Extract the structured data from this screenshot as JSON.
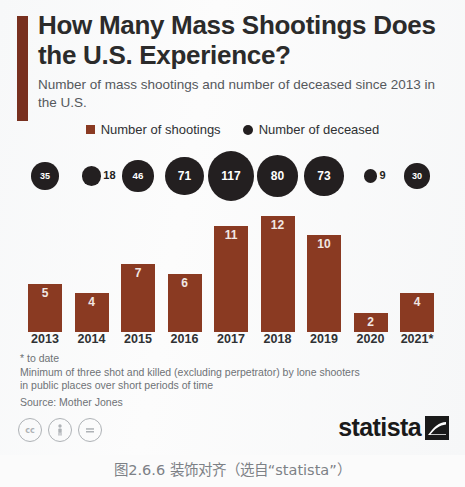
{
  "header": {
    "title": "How Many Mass Shootings Does the U.S. Experience?",
    "subtitle": "Number of mass shootings and number of deceased since 2013 in the U.S.",
    "accent_color": "#78301f"
  },
  "legend": {
    "shootings_label": "Number of shootings",
    "deceased_label": "Number of deceased",
    "shootings_color": "#8a3a22",
    "deceased_color": "#231f20"
  },
  "chart_data": {
    "type": "bar",
    "title": "How Many Mass Shootings Does the U.S. Experience?",
    "subtitle": "Number of mass shootings and number of deceased since 2013 in the U.S.",
    "xlabel": "",
    "ylabel": "",
    "grid": false,
    "legend_position": "top-center",
    "categories": [
      "2013",
      "2014",
      "2015",
      "2016",
      "2017",
      "2018",
      "2019",
      "2020",
      "2021*"
    ],
    "series": [
      {
        "name": "Number of shootings",
        "type": "bar",
        "color": "#8a3a22",
        "values": [
          5,
          4,
          7,
          6,
          11,
          12,
          10,
          2,
          4
        ]
      },
      {
        "name": "Number of deceased",
        "type": "bubble",
        "color": "#231f20",
        "values": [
          35,
          18,
          46,
          71,
          117,
          80,
          73,
          9,
          30
        ]
      }
    ],
    "ylim": [
      0,
      13
    ]
  },
  "footnotes": {
    "asterisk": "* to date",
    "definition_line1": "Minimum of three shot and killed (excluding perpetrator) by lone shooters",
    "definition_line2": "in public places over short periods of time",
    "source": "Source: Mother Jones"
  },
  "footer": {
    "cc_icons": [
      "creative-commons-icon",
      "attribution-icon",
      "no-derivatives-icon"
    ],
    "brand": "statista"
  },
  "caption": "图2.6.6  装饰对齐（选自“statista”）"
}
